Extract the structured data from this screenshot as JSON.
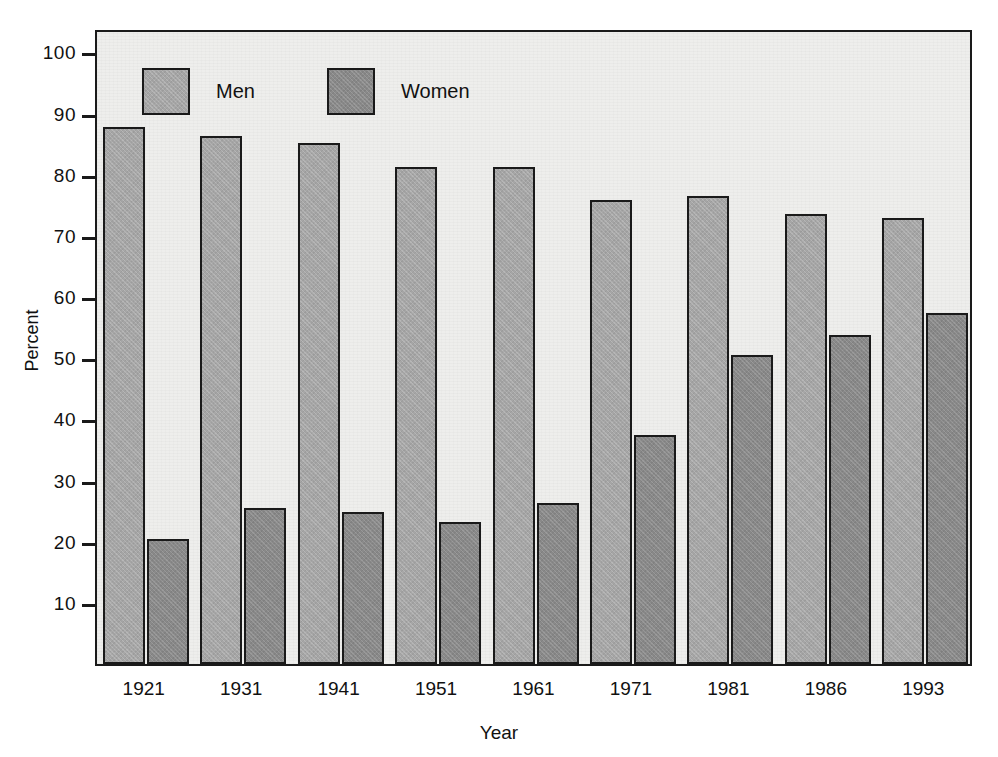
{
  "chart_data": {
    "type": "bar",
    "title": "",
    "subtitle": "",
    "xlabel": "Year",
    "ylabel": "Percent",
    "categories": [
      "1921",
      "1931",
      "1941",
      "1951",
      "1961",
      "1971",
      "1981",
      "1986",
      "1993"
    ],
    "series": [
      {
        "name": "Men",
        "color": "#a7a7a7",
        "values": [
          87.8,
          86.3,
          85.2,
          81.3,
          81.3,
          75.9,
          76.5,
          73.6,
          73.0
        ]
      },
      {
        "name": "Women",
        "color": "#8a8a8a",
        "values": [
          20.5,
          25.5,
          24.9,
          23.2,
          26.4,
          37.4,
          50.6,
          53.8,
          57.4
        ]
      }
    ],
    "ylim": [
      0,
      104
    ],
    "y_ticks": [
      10,
      20,
      30,
      40,
      50,
      60,
      70,
      80,
      90,
      100
    ],
    "y_tick_labels": [
      "10",
      "20",
      "30",
      "40",
      "50",
      "60",
      "70",
      "80",
      "90",
      "100"
    ],
    "grid": false,
    "legend_position": "inside-top-left",
    "legend": [
      {
        "label": "Men",
        "color": "#a7a7a7"
      },
      {
        "label": "Women",
        "color": "#8a8a8a"
      }
    ],
    "plot_background": "#eeeeec",
    "axis_color": "#1a1a1a",
    "bar_edge_color": "#1a1a1a"
  }
}
